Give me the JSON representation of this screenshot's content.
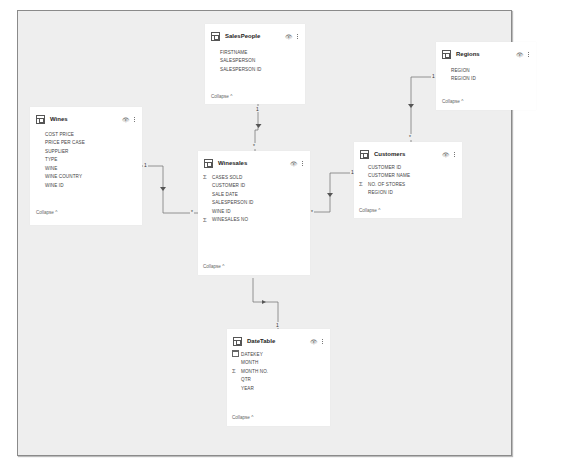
{
  "tables": {
    "salespeople": {
      "title": "SalesPeople",
      "fields": [
        {
          "name": "FIRSTNAME",
          "icon": ""
        },
        {
          "name": "SALESPERSON",
          "icon": ""
        },
        {
          "name": "SALESPERSON ID",
          "icon": ""
        }
      ],
      "collapse_label": "Collapse ^"
    },
    "regions": {
      "title": "Regions",
      "fields": [
        {
          "name": "REGION",
          "icon": ""
        },
        {
          "name": "REGION ID",
          "icon": ""
        }
      ],
      "collapse_label": "Collapse ^"
    },
    "wines": {
      "title": "Wines",
      "fields": [
        {
          "name": "COST PRICE",
          "icon": ""
        },
        {
          "name": "PRICE PER CASE",
          "icon": ""
        },
        {
          "name": "SUPPLIER",
          "icon": ""
        },
        {
          "name": "TYPE",
          "icon": ""
        },
        {
          "name": "WINE",
          "icon": ""
        },
        {
          "name": "WINE COUNTRY",
          "icon": ""
        },
        {
          "name": "WINE ID",
          "icon": ""
        }
      ],
      "collapse_label": "Collapse ^"
    },
    "winesales": {
      "title": "Winesales",
      "fields": [
        {
          "name": "CASES SOLD",
          "icon": "Σ"
        },
        {
          "name": "CUSTOMER ID",
          "icon": ""
        },
        {
          "name": "SALE DATE",
          "icon": ""
        },
        {
          "name": "SALESPERSON ID",
          "icon": ""
        },
        {
          "name": "WINE ID",
          "icon": ""
        },
        {
          "name": "WINESALES NO",
          "icon": "Σ"
        }
      ],
      "collapse_label": "Collapse ^"
    },
    "customers": {
      "title": "Customers",
      "fields": [
        {
          "name": "CUSTOMER ID",
          "icon": ""
        },
        {
          "name": "CUSTOMER NAME",
          "icon": ""
        },
        {
          "name": "NO. OF STORES",
          "icon": "Σ"
        },
        {
          "name": "REGION ID",
          "icon": ""
        }
      ],
      "collapse_label": "Collapse ^"
    },
    "datetable": {
      "title": "DateTable",
      "fields": [
        {
          "name": "DATEKEY",
          "icon": "calendar"
        },
        {
          "name": "MONTH",
          "icon": ""
        },
        {
          "name": "MONTH NO.",
          "icon": "Σ"
        },
        {
          "name": "QTR",
          "icon": ""
        },
        {
          "name": "YEAR",
          "icon": ""
        }
      ],
      "collapse_label": "Collapse ^"
    }
  },
  "header_icons": {
    "visibility": "eye-icon",
    "more": "more-options-icon"
  },
  "relationships": {
    "one": "1",
    "many": "*"
  }
}
